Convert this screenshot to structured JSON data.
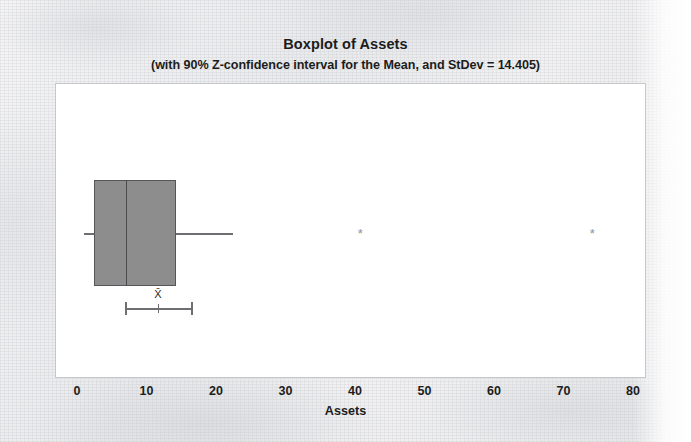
{
  "chart_data": {
    "type": "box",
    "title": "Boxplot of Assets",
    "subtitle": "(with 90% Z-confidence interval for the Mean, and StDev = 14.405)",
    "xlabel": "Assets",
    "ylabel": "",
    "orientation": "horizontal",
    "xlim": [
      0,
      80
    ],
    "xticks": [
      0,
      10,
      20,
      30,
      40,
      50,
      60,
      70,
      80
    ],
    "xtick_labels": [
      "0",
      "10",
      "20",
      "30",
      "40",
      "50",
      "60",
      "70",
      "80"
    ],
    "grid": false,
    "legend": "none",
    "stdev": 14.405,
    "confidence_level": "90%",
    "confidence_type": "Z-confidence interval for the Mean",
    "box": {
      "whisker_low": 0.9,
      "q1": 2.3,
      "median": 6.9,
      "q3": 14.1,
      "whisker_high": 22.3
    },
    "outliers": [
      40.6,
      74.0
    ],
    "outlier_marker": "*",
    "mean_ci": {
      "lower": 6.8,
      "mean": 11.5,
      "upper": 16.3,
      "label": "X̄"
    },
    "colors": {
      "box_fill": "#8d8d8d",
      "box_edge": "#555659",
      "median": "#4a4b4e",
      "whisker": "#6e6f72",
      "outlier": "#8e8f92",
      "plot_background": "#ffffff",
      "plot_border": "#c6c7c9",
      "page_background": "#eeeeee",
      "text": "#1c1c1c"
    }
  }
}
